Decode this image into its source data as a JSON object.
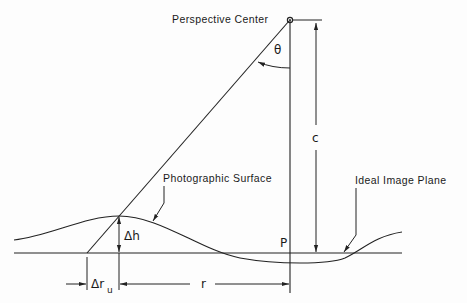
{
  "diagram": {
    "labels": {
      "perspective_center": "Perspective Center",
      "theta": "θ",
      "c": "c",
      "photographic_surface": "Photographic Surface",
      "ideal_image_plane": "Ideal Image Plane",
      "delta_h": "Δh",
      "p": "P",
      "delta_r": "Δr",
      "delta_r_sub": "u",
      "r": "r"
    },
    "colors": {
      "ink": "#222222",
      "background": "#fdfdfd"
    }
  }
}
